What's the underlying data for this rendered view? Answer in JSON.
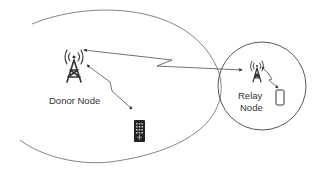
{
  "diagram": {
    "nodes": {
      "donor": {
        "label": "Donor Node",
        "icon": "cell-tower-icon"
      },
      "relay": {
        "label_line1": "Relay",
        "label_line2": "Node",
        "icon": "cell-tower-icon"
      },
      "ue_donor": {
        "icon": "mobile-phone-icon"
      },
      "ue_relay": {
        "icon": "mobile-phone-icon"
      }
    },
    "links": [
      {
        "from": "donor",
        "to": "relay",
        "type": "wireless-bidirectional"
      },
      {
        "from": "donor",
        "to": "ue_donor",
        "type": "wireless-bidirectional"
      },
      {
        "from": "relay",
        "to": "ue_relay",
        "type": "wireless-bidirectional"
      }
    ],
    "regions": [
      {
        "name": "donor-coverage",
        "shape": "ellipse"
      },
      {
        "name": "relay-coverage",
        "shape": "circle"
      }
    ],
    "colors": {
      "stroke": "#555555",
      "icon": "#333333",
      "text": "#333333"
    }
  }
}
